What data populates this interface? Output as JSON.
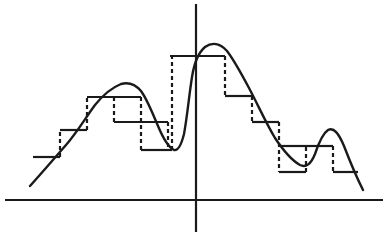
{
  "figure": {
    "title": "",
    "width": 390,
    "height": 236,
    "background_color": "#ffffff",
    "ink_color": "#1a1a1a"
  },
  "axes": {
    "x_axis": {
      "name": "horizontal-axis",
      "y": 200,
      "x_start": 5,
      "x_end": 383,
      "stroke_width": 2.2
    },
    "y_axis": {
      "name": "vertical-axis",
      "x": 196,
      "y_start": 4,
      "y_end": 232,
      "stroke_width": 2.2
    },
    "origin": [
      196,
      200
    ],
    "ticks": [],
    "tick_labels": [],
    "grid": false
  },
  "curve": {
    "name": "analog-signal-curve",
    "stroke_width": 2.4,
    "style": "solid",
    "path": "M 30,186 L 44,170 L 58,154 L 72,138 L 83,124 L 92,110 L 100,99 L 108,92 L 116,87 L 124,84 L 131,83 L 137,85 L 143,91 L 149,101 L 155,115 L 161,130 L 166,142 L 170,148 L 174,150 L 177,149 L 180,143 L 183,128 L 186,106 L 189,84 L 192,67 L 196,56 L 200,49 L 205,45 L 211,43 L 218,44 L 225,49 L 232,57 L 240,68 L 248,82 L 256,97 L 264,112 L 272,127 L 280,141 L 288,153 L 295,161 L 301,166 L 306,167 L 311,164 L 315,156 L 319,145 L 323,136 L 328,130 L 333,128 L 338,131 L 343,140 L 348,153 L 353,167 L 358,179 L 363,190"
  },
  "staircase": {
    "name": "quantized-staircase",
    "stroke_width": 2.2,
    "top_style": "solid",
    "riser_style": "dashed",
    "riser_dash_pattern": "4,3",
    "step_width": 27,
    "steps": [
      {
        "x_start": 33,
        "x_end": 60,
        "y": 157
      },
      {
        "x_start": 60,
        "x_end": 87,
        "y": 130
      },
      {
        "x_start": 87,
        "x_end": 114,
        "y": 97
      },
      {
        "x_start": 114,
        "x_end": 141,
        "y": 97
      },
      {
        "x_start": 141,
        "x_end": 168,
        "y": 122
      },
      {
        "x_start": 168,
        "x_end": 196,
        "y": 150
      },
      {
        "x_start": 170,
        "x_end": 225,
        "y": 56
      },
      {
        "x_start": 225,
        "x_end": 252,
        "y": 96
      },
      {
        "x_start": 252,
        "x_end": 279,
        "y": 96
      },
      {
        "x_start": 279,
        "x_end": 306,
        "y": 146
      },
      {
        "x_start": 306,
        "x_end": 333,
        "y": 172
      },
      {
        "x_start": 306,
        "x_end": 333,
        "y": 146
      },
      {
        "x_start": 333,
        "x_end": 358,
        "y": 172
      }
    ]
  },
  "chart_data": {
    "type": "line",
    "title": "",
    "xlabel": "",
    "ylabel": "",
    "grid": false,
    "legend": "none",
    "xlim": [
      0,
      390
    ],
    "ylim": [
      236,
      0
    ],
    "series": [
      {
        "name": "analog-signal",
        "style": "smooth-solid",
        "description": "Continuous waveform: gentle rise, a medium left hump, a dip, a tall central peak at the y-axis, a long decline, a small dip, a short right hump, then a final decline",
        "x": [
          30,
          44,
          58,
          72,
          83,
          92,
          100,
          108,
          116,
          124,
          131,
          137,
          143,
          149,
          155,
          161,
          166,
          170,
          174,
          177,
          180,
          183,
          186,
          189,
          192,
          196,
          200,
          205,
          211,
          218,
          225,
          232,
          240,
          248,
          256,
          264,
          272,
          280,
          288,
          295,
          301,
          306,
          311,
          315,
          319,
          323,
          328,
          333,
          338,
          343,
          348,
          353,
          358,
          363
        ],
        "y": [
          186,
          170,
          154,
          138,
          124,
          110,
          99,
          92,
          87,
          84,
          83,
          85,
          91,
          101,
          115,
          130,
          142,
          148,
          150,
          149,
          143,
          128,
          106,
          84,
          67,
          56,
          49,
          45,
          43,
          44,
          49,
          57,
          68,
          82,
          97,
          112,
          127,
          141,
          153,
          161,
          166,
          167,
          164,
          156,
          145,
          136,
          130,
          128,
          131,
          140,
          153,
          167,
          179,
          190
        ]
      },
      {
        "name": "quantized-staircase",
        "style": "step-dashed-risers",
        "description": "Sample-and-hold quantization of the analog signal; horizontal treads solid, vertical risers dashed",
        "step_x_edges": [
          33,
          60,
          87,
          114,
          141,
          168,
          196,
          225,
          252,
          279,
          306,
          333,
          358
        ],
        "step_levels": [
          157,
          130,
          97,
          97,
          122,
          150,
          56,
          96,
          96,
          146,
          172,
          172
        ]
      }
    ]
  }
}
